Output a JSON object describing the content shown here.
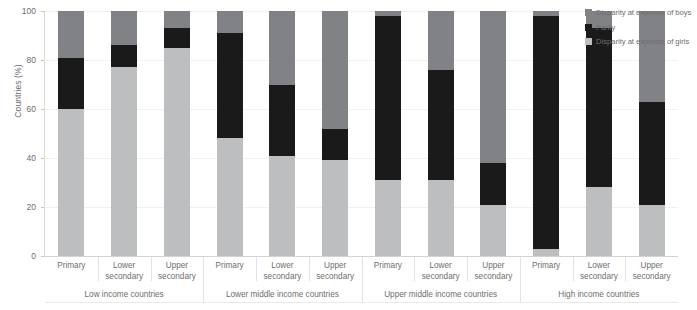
{
  "chart_data": {
    "type": "bar",
    "stacked": true,
    "title": "",
    "xlabel": "",
    "ylabel": "Countries (%)",
    "ylim": [
      0,
      100
    ],
    "yticks": [
      0,
      20,
      40,
      60,
      80,
      100
    ],
    "grid": true,
    "legend_position": "right",
    "categories": [
      "Primary",
      "Lower secondary",
      "Upper secondary",
      "Primary",
      "Lower secondary",
      "Upper secondary",
      "Primary",
      "Lower secondary",
      "Upper secondary",
      "Primary",
      "Lower secondary",
      "Upper secondary"
    ],
    "groups": [
      {
        "label": "Low income countries",
        "categories": [
          "Primary",
          "Lower secondary",
          "Upper secondary"
        ]
      },
      {
        "label": "Lower middle income countries",
        "categories": [
          "Primary",
          "Lower secondary",
          "Upper secondary"
        ]
      },
      {
        "label": "Upper middle income countries",
        "categories": [
          "Primary",
          "Lower secondary",
          "Upper secondary"
        ]
      },
      {
        "label": "High income countries",
        "categories": [
          "Primary",
          "Lower secondary",
          "Upper secondary"
        ]
      }
    ],
    "series": [
      {
        "name": "Disparity at expense of girls",
        "color": "#bcbec0",
        "values": [
          60,
          77,
          85,
          48,
          41,
          39,
          31,
          31,
          21,
          3,
          28,
          21
        ]
      },
      {
        "name": "Parity",
        "color": "#1a1a1a",
        "values": [
          21,
          9,
          8,
          43,
          29,
          13,
          67,
          45,
          17,
          95,
          65,
          42
        ]
      },
      {
        "name": "Disparity at expense of boys",
        "color": "#808285",
        "values": [
          19,
          14,
          7,
          9,
          30,
          48,
          2,
          24,
          62,
          2,
          7,
          37
        ]
      }
    ],
    "legend": [
      {
        "label": "Disparity at expense of boys",
        "color": "#808285"
      },
      {
        "label": "Parity",
        "color": "#1a1a1a"
      },
      {
        "label": "Disparity at expense of girls",
        "color": "#bcbec0"
      }
    ]
  },
  "colors": {
    "boys": "#808285",
    "parity": "#1a1a1a",
    "girls": "#bcbec0",
    "axis": "#d9dadb",
    "grid": "#f1f1f2",
    "text": "#6d6e71",
    "background": "#ffffff"
  }
}
